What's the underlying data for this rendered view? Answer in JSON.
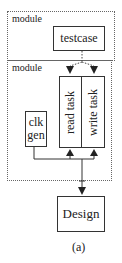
{
  "diagram": {
    "outer_modules": [
      {
        "label": "module"
      },
      {
        "label": "module"
      }
    ],
    "boxes": {
      "testcase": "testcase",
      "read_task": "read task",
      "write_task": "write task",
      "clk_gen_line1": "clk",
      "clk_gen_line2": "gen",
      "design": "Design"
    },
    "caption": "(a)",
    "edges": [
      {
        "from": "testcase",
        "to": "read task",
        "style": "dotted",
        "arrow": true
      },
      {
        "from": "testcase",
        "to": "write task",
        "style": "dotted",
        "arrow": true
      },
      {
        "from": "clk gen",
        "to": "read task",
        "style": "solid",
        "arrow": true
      },
      {
        "from": "clk gen",
        "to": "write task",
        "style": "solid",
        "arrow": true
      },
      {
        "from": "bus",
        "to": "Design",
        "style": "solid",
        "arrow": true,
        "bidirectional": true
      }
    ]
  }
}
